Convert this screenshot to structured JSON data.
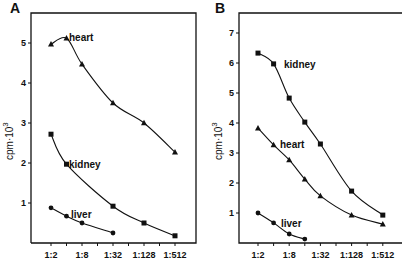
{
  "chart_data": [
    {
      "panel": "A",
      "type": "line",
      "ylabel": "cpm·10³",
      "xlabel": "",
      "x_tick_labels": [
        "1:2",
        "1:8",
        "1:32",
        "1:128",
        "1:512"
      ],
      "x_categories": [
        "1:2",
        "1:4",
        "1:8",
        "1:16",
        "1:32",
        "1:64",
        "1:128",
        "1:256",
        "1:512"
      ],
      "y_ticks": [
        1,
        2,
        3,
        4,
        5
      ],
      "ylim": [
        0,
        5.5
      ],
      "series": [
        {
          "name": "heart",
          "marker": "triangle",
          "x": [
            "1:2",
            "1:4",
            "1:8",
            "1:32",
            "1:128",
            "1:512"
          ],
          "values": [
            4.97,
            5.12,
            4.47,
            3.5,
            3.0,
            2.27
          ]
        },
        {
          "name": "kidney",
          "marker": "square",
          "x": [
            "1:2",
            "1:4",
            "1:32",
            "1:128",
            "1:512"
          ],
          "values": [
            2.72,
            1.97,
            0.92,
            0.5,
            0.18
          ]
        },
        {
          "name": "liver",
          "marker": "circle",
          "x": [
            "1:2",
            "1:4",
            "1:8",
            "1:32"
          ],
          "values": [
            0.88,
            0.67,
            0.5,
            0.25
          ]
        }
      ]
    },
    {
      "panel": "B",
      "type": "line",
      "ylabel": "cpm·10³",
      "xlabel": "",
      "x_tick_labels": [
        "1:2",
        "1:8",
        "1:32",
        "1:128",
        "1:512"
      ],
      "x_categories": [
        "1:2",
        "1:4",
        "1:8",
        "1:16",
        "1:32",
        "1:64",
        "1:128",
        "1:256",
        "1:512"
      ],
      "y_ticks": [
        1,
        2,
        3,
        4,
        5,
        6,
        7
      ],
      "ylim": [
        0,
        7.5
      ],
      "series": [
        {
          "name": "kidney",
          "marker": "square",
          "x": [
            "1:2",
            "1:4",
            "1:8",
            "1:16",
            "1:32",
            "1:128",
            "1:512"
          ],
          "values": [
            6.33,
            5.97,
            4.83,
            4.03,
            3.3,
            1.73,
            0.93
          ]
        },
        {
          "name": "heart",
          "marker": "triangle",
          "x": [
            "1:2",
            "1:4",
            "1:8",
            "1:16",
            "1:32",
            "1:128",
            "1:512"
          ],
          "values": [
            3.83,
            3.27,
            2.77,
            2.13,
            1.57,
            0.93,
            0.63
          ]
        },
        {
          "name": "liver",
          "marker": "circle",
          "x": [
            "1:2",
            "1:4",
            "1:8",
            "1:16"
          ],
          "values": [
            1.0,
            0.67,
            0.3,
            0.13
          ]
        }
      ]
    }
  ],
  "panels": {
    "a": {
      "letter": "A",
      "ylabel": "cpm·10",
      "ylabel_exp": "3",
      "labels": {
        "heart": "heart",
        "kidney": "kidney",
        "liver": "liver"
      }
    },
    "b": {
      "letter": "B",
      "ylabel": "cpm·10",
      "ylabel_exp": "3",
      "labels": {
        "kidney": "kidney",
        "heart": "heart",
        "liver": "liver"
      }
    }
  }
}
